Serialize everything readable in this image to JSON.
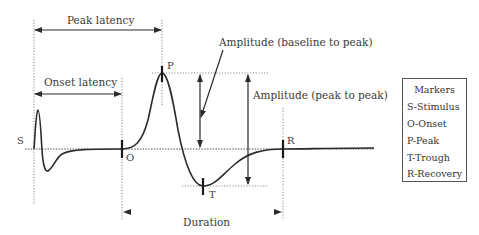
{
  "diagram": {
    "type": "evoked-potential waveform annotation",
    "labels": {
      "peak_latency": "Peak latency",
      "onset_latency": "Onset latency",
      "amp_baseline": "Amplitude (baseline to peak)",
      "amp_peak": "Amplitude (peak to peak)",
      "duration": "Duration"
    },
    "points": {
      "S": "S",
      "O": "O",
      "P": "P",
      "T": "T",
      "R": "R"
    },
    "colors": {
      "line": "#2b2b2b",
      "guide": "#8a8a8a",
      "duration_arrow": "#7fd88a",
      "text": "#3a3a3a"
    }
  },
  "legend": {
    "title": "Markers",
    "items": [
      {
        "label": "S-Stimulus"
      },
      {
        "label": "O-Onset"
      },
      {
        "label": "P-Peak"
      },
      {
        "label": "T-Trough"
      },
      {
        "label": "R-Recovery"
      }
    ]
  }
}
